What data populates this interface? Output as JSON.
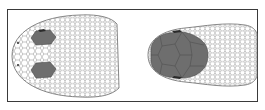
{
  "figure": {
    "panels": [
      {
        "id": "left-head",
        "description": "Dorsal view of snake head with two shaded supraocular scales",
        "highlight_regions": 2
      },
      {
        "id": "right-head",
        "description": "Dorsal view of snake head with shaded cluster of enlarged head plates",
        "highlight_regions": 1
      }
    ],
    "colors": {
      "border": "#3a3a3a",
      "scale_outline": "#8a8a8a",
      "shaded_scale": "#6e6e6e",
      "shaded_edge": "#4a4a4a",
      "eye_mark": "#2a2a2a",
      "background": "#ffffff"
    }
  }
}
